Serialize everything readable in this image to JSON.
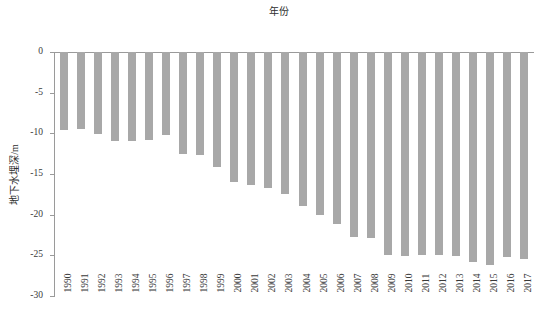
{
  "chart_data": {
    "type": "bar",
    "title": "年份",
    "xlabel": "年份",
    "ylabel": "地下水埋深/m",
    "orientation": "vertical-downward",
    "grid": false,
    "legend": null,
    "xlim_categories_count": 28,
    "ylim": [
      -30,
      0
    ],
    "yticks": [
      0,
      -5,
      -10,
      -15,
      -20,
      -25,
      -30
    ],
    "ytick_labels": [
      "0",
      "-5",
      "-10",
      "-15",
      "-20",
      "-25",
      "-30"
    ],
    "bar_color": "#a8a8a8",
    "axis_color": "#9a9a9a",
    "categories": [
      "1990",
      "1991",
      "1992",
      "1993",
      "1994",
      "1995",
      "1996",
      "1997",
      "1998",
      "1999",
      "2000",
      "2001",
      "2002",
      "2003",
      "2004",
      "2005",
      "2006",
      "2007",
      "2008",
      "2009",
      "2010",
      "2011",
      "2012",
      "2013",
      "2014",
      "2015",
      "2016",
      "2017"
    ],
    "values": [
      -9.6,
      -9.5,
      -10.1,
      -11.0,
      -10.9,
      -10.8,
      -10.2,
      -12.5,
      -12.7,
      -14.1,
      -16.0,
      -16.4,
      -16.7,
      -17.5,
      -18.9,
      -20.1,
      -21.2,
      -22.8,
      -22.9,
      -24.9,
      -25.1,
      -25.0,
      -25.0,
      -25.1,
      -25.8,
      -26.2,
      -25.2,
      -25.4
    ],
    "series": [
      {
        "name": "地下水埋深/m",
        "values": [
          -9.6,
          -9.5,
          -10.1,
          -11.0,
          -10.9,
          -10.8,
          -10.2,
          -12.5,
          -12.7,
          -14.1,
          -16.0,
          -16.4,
          -16.7,
          -17.5,
          -18.9,
          -20.1,
          -21.2,
          -22.8,
          -22.9,
          -24.9,
          -25.1,
          -25.0,
          -25.0,
          -25.1,
          -25.8,
          -26.2,
          -25.2,
          -25.4
        ]
      }
    ]
  }
}
